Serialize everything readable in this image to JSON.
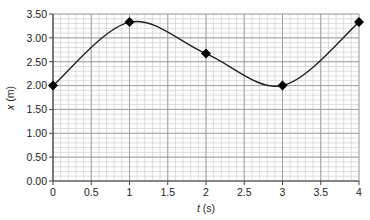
{
  "chart_data": {
    "type": "line",
    "title": "",
    "xlabel": "t (s)",
    "xlabel_var": "t",
    "xlabel_unit": " (s)",
    "ylabel": "x (m)",
    "ylabel_var": "x",
    "ylabel_unit": " (m)",
    "xlim": [
      0,
      4
    ],
    "ylim": [
      0,
      3.5
    ],
    "x_ticks": [
      0,
      0.5,
      1,
      1.5,
      2,
      2.5,
      3,
      3.5,
      4
    ],
    "x_tick_labels": [
      "0",
      "0.5",
      "1",
      "1.5",
      "2",
      "2.5",
      "3",
      "3.5",
      "4"
    ],
    "y_ticks": [
      0,
      0.5,
      1,
      1.5,
      2,
      2.5,
      3,
      3.5
    ],
    "y_tick_labels": [
      "0.00",
      "0.50",
      "1.00",
      "1.50",
      "2.00",
      "2.50",
      "3.00",
      "3.50"
    ],
    "grid": true,
    "minor_grid_step_x": 0.1,
    "minor_grid_step_y": 0.1,
    "legend": null,
    "series": [
      {
        "name": "x(t)",
        "marker": "diamond",
        "smooth": true,
        "x": [
          0,
          1,
          2,
          3,
          4
        ],
        "values": [
          2.0,
          3.33,
          2.67,
          2.0,
          3.33
        ]
      }
    ],
    "colors": {
      "line": "#222222",
      "marker": "#000000",
      "axis": "#444444",
      "major_grid": "#9a9a9a",
      "minor_grid": "#cfcfcf"
    }
  }
}
